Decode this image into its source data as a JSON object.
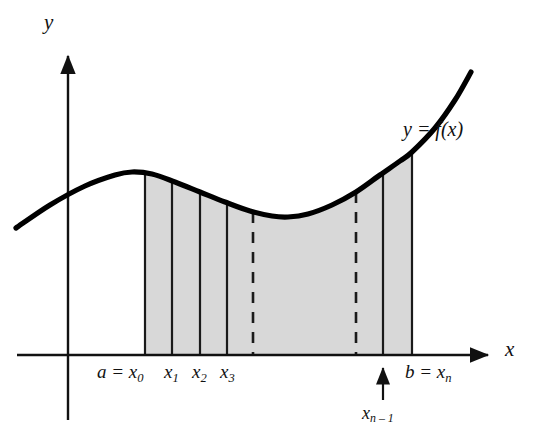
{
  "figure": {
    "axes": {
      "y_label": "y",
      "x_label": "x"
    },
    "curve_label": "y = f(x)",
    "tick_labels": {
      "left_endpoint": "a  =  x",
      "left_endpoint_sub": "0",
      "x1": "x",
      "x1_sub": "1",
      "x2": "x",
      "x2_sub": "2",
      "x3": "x",
      "x3_sub": "3",
      "right_endpoint": "b  =  x",
      "right_endpoint_sub": "n",
      "x_n_minus_1": "x",
      "x_n_minus_1_sub": "n – 1"
    },
    "colors": {
      "ink": "#111111",
      "curve": "#000000",
      "shade_fill": "#d8d8d8",
      "shade_edge": "#1a1a1a",
      "background": "#ffffff"
    }
  },
  "chart_data": {
    "type": "area",
    "xlabel": "x",
    "ylabel": "y",
    "grid": false,
    "legend": "none",
    "annotations": [
      "y = f(x)"
    ],
    "axis_origin_px": [
      68,
      355
    ],
    "x_axis_extent_px": [
      17,
      495
    ],
    "y_axis_extent_px": [
      50,
      420
    ],
    "curve_points_px": [
      [
        16,
        228
      ],
      [
        50,
        205
      ],
      [
        85,
        186
      ],
      [
        115,
        175
      ],
      [
        132,
        172
      ],
      [
        152,
        174
      ],
      [
        175,
        182
      ],
      [
        200,
        192
      ],
      [
        225,
        202
      ],
      [
        250,
        211
      ],
      [
        272,
        216
      ],
      [
        288,
        217
      ],
      [
        308,
        214
      ],
      [
        332,
        205
      ],
      [
        356,
        192
      ],
      [
        380,
        175
      ],
      [
        400,
        161
      ],
      [
        412,
        152
      ],
      [
        435,
        128
      ],
      [
        455,
        100
      ],
      [
        471,
        72
      ]
    ],
    "shaded_region": {
      "x_start_px": 145,
      "x_end_px": 412,
      "baseline_y_px": 355,
      "fill": "#d8d8d8"
    },
    "partition_lines": [
      {
        "label": "x0",
        "x_px": 145,
        "style": "solid",
        "top_y_px": 173
      },
      {
        "label": "x1",
        "x_px": 172,
        "style": "solid",
        "top_y_px": 181
      },
      {
        "label": "x2",
        "x_px": 200,
        "style": "solid",
        "top_y_px": 192
      },
      {
        "label": "x3",
        "x_px": 227,
        "style": "solid",
        "top_y_px": 203
      },
      {
        "label": "gap-left",
        "x_px": 253,
        "style": "dashed",
        "top_y_px": 212
      },
      {
        "label": "gap-right",
        "x_px": 356,
        "style": "dashed",
        "top_y_px": 192
      },
      {
        "label": "xn-1",
        "x_px": 383,
        "style": "solid",
        "top_y_px": 173
      },
      {
        "label": "xn",
        "x_px": 412,
        "style": "solid",
        "top_y_px": 152
      }
    ],
    "pointer_arrow": {
      "label": "x_n_minus_1",
      "x_px": 383,
      "from_y_px": 400,
      "to_y_px": 362
    }
  }
}
